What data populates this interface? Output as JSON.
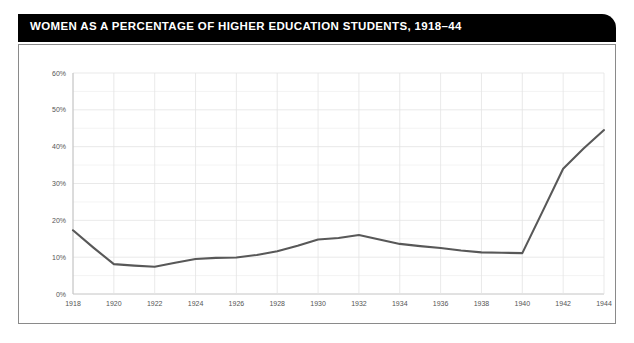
{
  "card": {
    "title": "WOMEN AS A PERCENTAGE OF HIGHER EDUCATION STUDENTS, 1918–44"
  },
  "chart_data": {
    "type": "line",
    "title": "WOMEN AS A PERCENTAGE OF HIGHER EDUCATION STUDENTS, 1918–44",
    "xlabel": "",
    "ylabel": "",
    "xlim": [
      1918,
      1944
    ],
    "ylim": [
      0,
      60
    ],
    "grid": true,
    "legend": "none",
    "line_color": "#585858",
    "x": [
      1918,
      1919,
      1920,
      1921,
      1922,
      1923,
      1924,
      1925,
      1926,
      1927,
      1928,
      1929,
      1930,
      1931,
      1932,
      1933,
      1934,
      1935,
      1936,
      1937,
      1938,
      1939,
      1940,
      1941,
      1942,
      1943,
      1944
    ],
    "values": [
      17.3,
      12.6,
      8.1,
      7.7,
      7.4,
      8.5,
      9.5,
      9.8,
      9.9,
      10.6,
      11.6,
      13.1,
      14.8,
      15.2,
      16.0,
      14.8,
      13.6,
      13.0,
      12.5,
      11.8,
      11.3,
      11.2,
      11.1,
      22.5,
      34.0,
      39.5,
      44.5
    ],
    "x_ticks": [
      1918,
      1920,
      1922,
      1924,
      1926,
      1928,
      1930,
      1932,
      1934,
      1936,
      1938,
      1940,
      1942,
      1944
    ],
    "x_tick_labels": [
      "1918",
      "1920",
      "1922",
      "1924",
      "1926",
      "1928",
      "1930",
      "1932",
      "1934",
      "1936",
      "1938",
      "1940",
      "1942",
      "1944"
    ],
    "y_ticks": [
      0,
      10,
      20,
      30,
      40,
      50,
      60
    ],
    "y_tick_labels": [
      "0%",
      "10%",
      "20%",
      "30%",
      "40%",
      "50%",
      "60%"
    ]
  }
}
